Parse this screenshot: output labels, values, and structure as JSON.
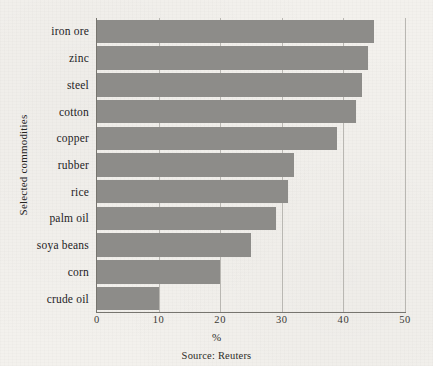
{
  "chart_data": {
    "type": "bar",
    "orientation": "horizontal",
    "title": "",
    "xlabel": "%",
    "ylabel": "Selected commodities",
    "xlim": [
      0,
      50
    ],
    "xticks": [
      0,
      10,
      20,
      30,
      40,
      50
    ],
    "xtick_labels": [
      "0",
      "10",
      "20",
      "30",
      "40",
      "50"
    ],
    "grid": true,
    "grid_axis": "x",
    "legend": false,
    "categories": [
      "iron ore",
      "zinc",
      "steel",
      "cotton",
      "copper",
      "rubber",
      "rice",
      "palm oil",
      "soya beans",
      "corn",
      "crude oil"
    ],
    "values": [
      45,
      44,
      43,
      42,
      39,
      32,
      31,
      29,
      25,
      20,
      10
    ],
    "bar_color": "#8d8c89",
    "background_color": "#f3f1ed",
    "annotations": [
      "Source: Reuters"
    ]
  },
  "figure": {
    "source_note": "Source: Reuters",
    "axis_label_x": "%",
    "axis_label_y": "Selected commodities"
  }
}
